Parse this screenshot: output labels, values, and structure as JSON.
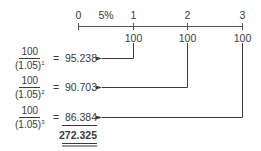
{
  "timeline": {
    "rate_label": "5%",
    "periods": [
      "0",
      "1",
      "2",
      "3"
    ],
    "cash_flows": [
      "100",
      "100",
      "100"
    ]
  },
  "rows": [
    {
      "numerator": "100",
      "base": "(1.05)",
      "exponent": "1",
      "equals": "=",
      "value": "95.238"
    },
    {
      "numerator": "100",
      "base": "(1.05)",
      "exponent": "2",
      "equals": "=",
      "value": "90.703"
    },
    {
      "numerator": "100",
      "base": "(1.05)",
      "exponent": "3",
      "equals": "=",
      "value": "86.384"
    }
  ],
  "total": "272.325",
  "colors": {
    "ink": "#3a3a3a",
    "background": "#ffffff"
  }
}
